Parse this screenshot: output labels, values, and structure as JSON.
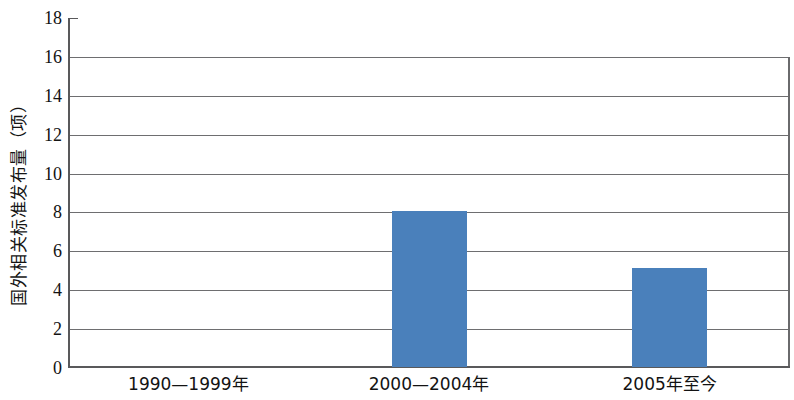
{
  "chart_data": {
    "type": "bar",
    "title": "",
    "subtitle": "",
    "xlabel": "",
    "ylabel": "国外相关标准发布量（项）",
    "categories": [
      "1990—1999年",
      "2000—2004年",
      "2005年至今"
    ],
    "values": [
      0,
      8,
      5.1
    ],
    "series": [
      {
        "name": "国外相关标准发布量",
        "values": [
          0,
          8,
          5.1
        ]
      }
    ],
    "ylim": [
      0,
      18
    ],
    "ytick_labels": [
      "0",
      "2",
      "4",
      "6",
      "8",
      "10",
      "12",
      "14",
      "16",
      "18"
    ],
    "ytick_values": [
      0,
      2,
      4,
      6,
      8,
      10,
      12,
      14,
      16,
      18
    ],
    "grid": true,
    "grid_axis": "y",
    "legend": false,
    "legend_position": "none",
    "bar_color": "#4a80bb",
    "axis_color": "#59595b",
    "grid_color": "#6e6e70",
    "background": "#ffffff"
  }
}
